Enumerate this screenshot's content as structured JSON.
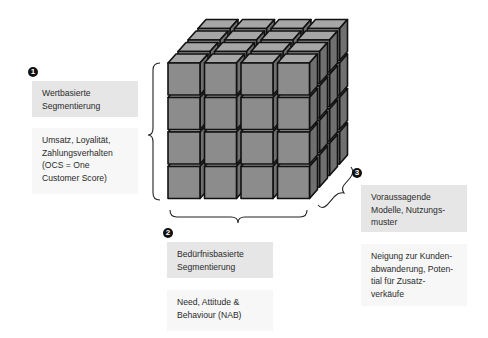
{
  "diagram": {
    "type": "segmentation-cube",
    "cube": {
      "cols": 4,
      "rows": 4,
      "layers": 4,
      "colors": {
        "front": "#8c8c8c",
        "top": "#a6a6a6",
        "side": "#707070",
        "edge": "#111111"
      }
    },
    "dimensions": [
      {
        "number": "1",
        "title_lines": [
          "Wertbasierte",
          "Segmentierung"
        ],
        "desc_lines": [
          "Umsatz, Loyalität,",
          "Zahlungsverhalten",
          "(OCS = One",
          "Customer Score)"
        ]
      },
      {
        "number": "2",
        "title_lines": [
          "Bedürfnisbasierte",
          "Segmentierung"
        ],
        "desc_lines": [
          "Need, Attitude &",
          "Behaviour (NAB)"
        ]
      },
      {
        "number": "3",
        "title_lines": [
          "Voraussagende",
          "Modelle, Nutzungs-",
          "muster"
        ],
        "desc_lines": [
          "Neigung zur Kunden-",
          "abwanderung, Poten-",
          "tial für Zusatz-",
          "verkäufe"
        ]
      }
    ]
  }
}
